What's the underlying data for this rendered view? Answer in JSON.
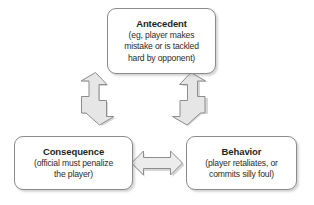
{
  "diagram": {
    "type": "cycle-flow-diagram",
    "background_color": "#ffffff",
    "node_border_color": "#8a8a8a",
    "node_fill_color": "#ffffff",
    "arrow_outline_color": "#8d8d8d",
    "arrow_fill_color": "#e8e8e8",
    "text_color": "#231f20",
    "nodes": [
      {
        "id": "antecedent",
        "title": "Antecedent",
        "description": "(eg, player makes\nmistake or is tackled\nhard by opponent)"
      },
      {
        "id": "consequence",
        "title": "Consequence",
        "description": "(official must penalize\nthe player)"
      },
      {
        "id": "behavior",
        "title": "Behavior",
        "description": "(player retaliates, or\ncommits silly foul)"
      }
    ],
    "connectors": [
      {
        "id": "antecedent-consequence",
        "icon": "double-headed-diagonal-arrow-icon",
        "from": "antecedent",
        "to": "consequence",
        "direction": "bidirectional",
        "orientation": "diagonal-down-left"
      },
      {
        "id": "antecedent-behavior",
        "icon": "double-headed-diagonal-arrow-icon",
        "from": "antecedent",
        "to": "behavior",
        "direction": "bidirectional",
        "orientation": "diagonal-down-right"
      },
      {
        "id": "consequence-behavior",
        "icon": "double-headed-horizontal-arrow-icon",
        "from": "consequence",
        "to": "behavior",
        "direction": "bidirectional",
        "orientation": "horizontal"
      }
    ]
  }
}
